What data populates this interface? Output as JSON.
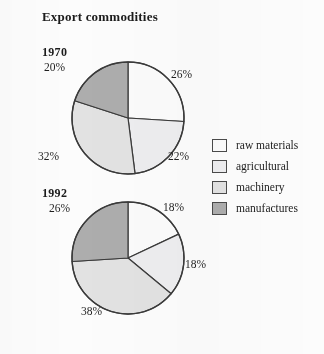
{
  "figure": {
    "title": "Export commodities",
    "background_color": "#fcfcfc",
    "text_color": "#1c1c1c"
  },
  "legend": {
    "items": [
      {
        "label": "raw materials",
        "color": "#fbfbfb",
        "swatch_name": "legend-swatch-raw-materials"
      },
      {
        "label": "agricultural",
        "color": "#ededef",
        "swatch_name": "legend-swatch-agricultural"
      },
      {
        "label": "machinery",
        "color": "#e2e2e2",
        "swatch_name": "legend-swatch-machinery"
      },
      {
        "label": "manufactures",
        "color": "#adadad",
        "swatch_name": "legend-swatch-manufactures"
      }
    ]
  },
  "charts": {
    "pie_1970": {
      "year": "1970",
      "labels": {
        "raw_materials": "26%",
        "agricultural": "22%",
        "machinery": "32%",
        "manufactures": "20%"
      }
    },
    "pie_1992": {
      "year": "1992",
      "labels": {
        "raw_materials": "18%",
        "agricultural": "18%",
        "machinery": "38%",
        "manufactures": "26%"
      }
    }
  },
  "chart_data": [
    {
      "type": "pie",
      "title": "1970",
      "subtitle": "Export commodities",
      "categories": [
        "raw materials",
        "agricultural",
        "machinery",
        "manufactures"
      ],
      "values": [
        26,
        22,
        32,
        20
      ],
      "value_labels": [
        "26%",
        "22%",
        "32%",
        "20%"
      ],
      "colors": [
        "#fbfbfb",
        "#ededef",
        "#e2e2e2",
        "#adadad"
      ],
      "units": "percent",
      "total": 100,
      "start_angle_deg": 0,
      "direction": "clockwise",
      "legend_position": "right",
      "grid": false,
      "xlabel": "",
      "ylabel": ""
    },
    {
      "type": "pie",
      "title": "1992",
      "subtitle": "Export commodities",
      "categories": [
        "raw materials",
        "agricultural",
        "machinery",
        "manufactures"
      ],
      "values": [
        18,
        18,
        38,
        26
      ],
      "value_labels": [
        "18%",
        "18%",
        "38%",
        "26%"
      ],
      "colors": [
        "#fbfbfb",
        "#ededef",
        "#e2e2e2",
        "#adadad"
      ],
      "units": "percent",
      "total": 100,
      "start_angle_deg": 0,
      "direction": "clockwise",
      "legend_position": "right",
      "grid": false,
      "xlabel": "",
      "ylabel": ""
    }
  ]
}
